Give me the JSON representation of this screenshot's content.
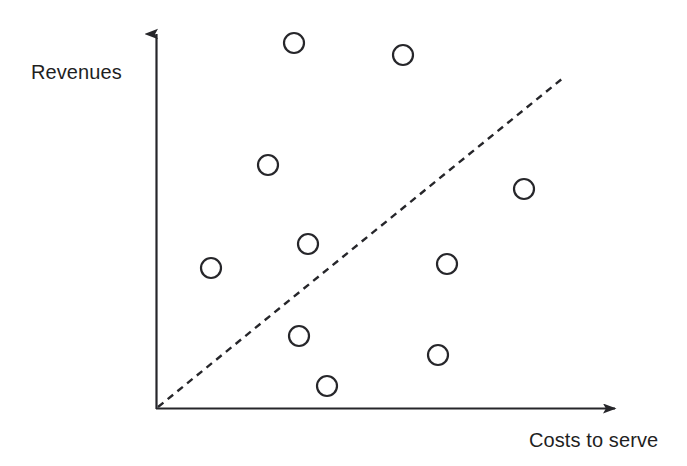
{
  "figure": {
    "background_color": "#ffffff",
    "ink_color": "#26262a",
    "width": 687,
    "height": 466
  },
  "labels": {
    "y_axis": "Revenues",
    "x_axis": "Costs to serve"
  },
  "chart_data": {
    "type": "scatter",
    "title": "",
    "xlabel": "Costs to serve",
    "ylabel": "Revenues",
    "xlim": [
      0,
      100
    ],
    "ylim": [
      0,
      100
    ],
    "grid": false,
    "legend": null,
    "axis_ticks": {
      "x": [],
      "y": []
    },
    "axes_style": {
      "type": "arrowed-L",
      "origin_px": [
        156,
        409
      ],
      "x_axis_end_px": [
        625,
        409
      ],
      "y_axis_end_px": [
        156,
        25
      ],
      "line_width_px": 2.2,
      "arrowheads": true
    },
    "marker": {
      "shape": "open-circle",
      "radius_px": 10,
      "stroke_width_px": 2.2,
      "fill": "none",
      "stroke": "#26262a"
    },
    "points": [
      {
        "id": "p1",
        "label": "",
        "x": 29.4,
        "y": 95.3,
        "px": 294,
        "py": 43
      },
      {
        "id": "p2",
        "label": "",
        "x": 52.7,
        "y": 92.2,
        "px": 403,
        "py": 55
      },
      {
        "id": "p3",
        "label": "",
        "x": 23.9,
        "y": 63.5,
        "px": 268,
        "py": 165
      },
      {
        "id": "p4",
        "label": "",
        "x": 78.5,
        "y": 57.3,
        "px": 524,
        "py": 189
      },
      {
        "id": "p5",
        "label": "",
        "x": 32.4,
        "y": 43.0,
        "px": 308,
        "py": 244
      },
      {
        "id": "p6",
        "label": "",
        "x": 11.7,
        "y": 36.7,
        "px": 211,
        "py": 268
      },
      {
        "id": "p7",
        "label": "",
        "x": 62.1,
        "y": 37.8,
        "px": 447,
        "py": 264
      },
      {
        "id": "p8",
        "label": "",
        "x": 30.5,
        "y": 19.0,
        "px": 299,
        "py": 336
      },
      {
        "id": "p9",
        "label": "",
        "x": 60.1,
        "y": 14.1,
        "px": 438,
        "py": 355
      },
      {
        "id": "p10",
        "label": "",
        "x": 36.5,
        "y": 6.0,
        "px": 327,
        "py": 386
      }
    ],
    "reference_line": {
      "name": "break-even-diagonal",
      "style": "dashed",
      "dash_pattern_px": [
        7,
        5.5
      ],
      "stroke_width_px": 2.4,
      "stroke": "#26262a",
      "from_px": [
        158,
        407
      ],
      "to_px": [
        563,
        78
      ],
      "from_xy": [
        0,
        0
      ],
      "to_xy": [
        86.8,
        83.6
      ],
      "note": "cost = revenue diagonal separating profitable from unprofitable customers"
    }
  }
}
